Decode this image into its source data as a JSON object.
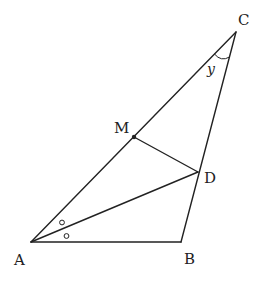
{
  "diagram": {
    "type": "triangle-geometry",
    "points": {
      "A": {
        "label": "A",
        "x": 31,
        "y": 242
      },
      "B": {
        "label": "B",
        "x": 181,
        "y": 242
      },
      "C": {
        "label": "C",
        "x": 236,
        "y": 32
      },
      "M": {
        "label": "M",
        "x": 134,
        "y": 137
      },
      "D": {
        "label": "D",
        "x": 198,
        "y": 172
      }
    },
    "segments": [
      [
        "A",
        "B"
      ],
      [
        "B",
        "C"
      ],
      [
        "A",
        "C"
      ],
      [
        "A",
        "D"
      ],
      [
        "M",
        "D"
      ]
    ],
    "angle_label": {
      "vertex": "C",
      "text": "y"
    },
    "angle_marks": {
      "vertex": "A",
      "symbol": "○",
      "count": 2,
      "meaning": "AD bisects angle A"
    }
  }
}
